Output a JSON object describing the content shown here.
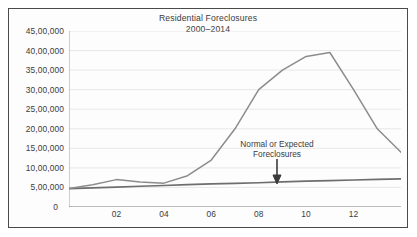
{
  "chart_data": {
    "type": "line",
    "title": "Residential Foreclosures",
    "subtitle": "2000–2014",
    "xlabel": "",
    "ylabel": "",
    "grid": true,
    "legend_position": "none",
    "xlim": [
      2000,
      2014
    ],
    "ylim": [
      0,
      4500000
    ],
    "x": [
      2000,
      2001,
      2002,
      2003,
      2004,
      2005,
      2006,
      2007,
      2008,
      2009,
      2010,
      2011,
      2012,
      2013,
      2014
    ],
    "y_tick_labels": [
      "45,00,000",
      "40,00,000",
      "35,00,000",
      "30,00,000",
      "25,00,000",
      "20,00,000",
      "15,00,000",
      "10,00,000",
      "5,00,000",
      "0"
    ],
    "y_tick_values": [
      4500000,
      4000000,
      3500000,
      3000000,
      2500000,
      2000000,
      1500000,
      1000000,
      500000,
      0
    ],
    "x_tick_labels": [
      "02",
      "04",
      "06",
      "08",
      "10",
      "12"
    ],
    "x_tick_values": [
      2002,
      2004,
      2006,
      2008,
      2010,
      2012
    ],
    "series": [
      {
        "name": "Residential Foreclosures",
        "color": "#8c8c8c",
        "values": [
          470000,
          570000,
          700000,
          640000,
          610000,
          800000,
          1200000,
          2000000,
          3000000,
          3500000,
          3850000,
          3950000,
          3000000,
          2000000,
          1400000
        ]
      },
      {
        "name": "Normal or Expected Foreclosures",
        "color": "#6e6e6e",
        "values": [
          470000,
          490000,
          510000,
          530000,
          550000,
          570000,
          590000,
          605000,
          620000,
          640000,
          660000,
          675000,
          690000,
          705000,
          720000
        ]
      }
    ],
    "annotations": [
      {
        "name": "normal-expected-foreclosures",
        "line1": "Normal or Expected",
        "line2": "Foreclosures",
        "arrow": "down-arrow",
        "target_x": 2009.6,
        "target_y": 640000
      }
    ]
  }
}
